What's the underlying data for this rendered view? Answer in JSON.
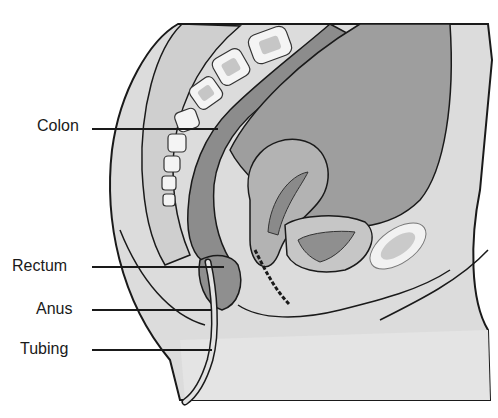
{
  "figure": {
    "type": "sagittal-pelvis-enema-diagram",
    "labels": [
      {
        "text": "Colon",
        "x": 37,
        "y": 117,
        "line_x1": 92,
        "line_x2": 218,
        "line_y": 128
      },
      {
        "text": "Rectum",
        "x": 12,
        "y": 257,
        "line_x1": 92,
        "line_x2": 224,
        "line_y": 266
      },
      {
        "text": "Anus",
        "x": 36,
        "y": 300,
        "line_x1": 92,
        "line_x2": 212,
        "line_y": 309
      },
      {
        "text": "Tubing",
        "x": 20,
        "y": 340,
        "line_x1": 92,
        "line_x2": 212,
        "line_y": 349
      }
    ],
    "caption_cropped": ""
  },
  "colors": {
    "outline": "#1a1a1a",
    "skin": "#d8d8d8",
    "tissue": "#bdbdbd",
    "colon_dark": "#8a8a8a",
    "colon_mid": "#a6a6a6",
    "bone": "#f4f4f4",
    "bone_inner": "#c9c9c9",
    "tube": "#e2e2e2"
  }
}
